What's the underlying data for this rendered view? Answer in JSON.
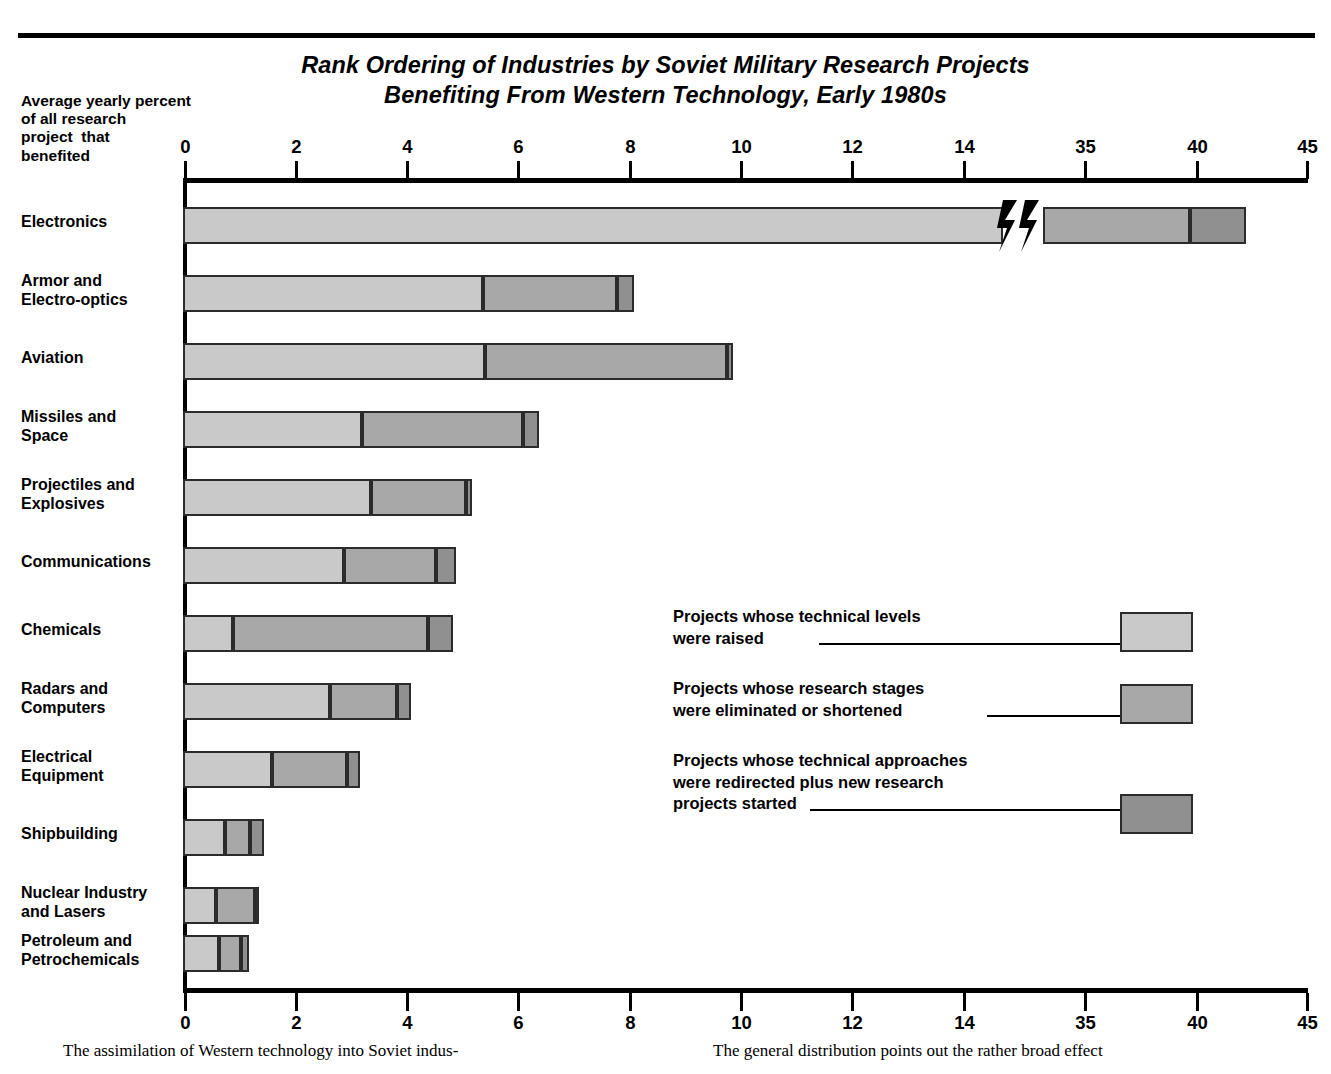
{
  "title": {
    "line1": "Rank Ordering of Industries by Soviet Military Research Projects",
    "line2": "Benefiting From Western Technology, Early 1980s"
  },
  "axis_caption": {
    "l1": "Average yearly percent",
    "l2": "of all research",
    "l3": "project  that",
    "l4": "benefited"
  },
  "legend": [
    {
      "l1": "Projects whose technical levels",
      "l2": "were raised",
      "l3": ""
    },
    {
      "l1": "Projects whose research stages",
      "l2": "were eliminated or shortened",
      "l3": ""
    },
    {
      "l1": "Projects whose technical approaches",
      "l2": "were redirected plus new research",
      "l3": "projects started"
    }
  ],
  "footer": {
    "left": "The assimilation of Western technology into Soviet indus-",
    "right": "The general distribution points out the rather broad effect"
  },
  "colors": {
    "light": "#c9c9c9",
    "medium": "#a8a8a8",
    "dark": "#909090",
    "outline": "#2b2b2b",
    "background": "#ffffff"
  },
  "chart_data": {
    "type": "bar",
    "orientation": "horizontal",
    "stacked": true,
    "title": "Rank Ordering of Industries by Soviet Military Research Projects Benefiting From Western Technology, Early 1980s",
    "xlabel": "Average yearly percent of all research project that benefited",
    "ylabel": "",
    "grid": false,
    "legend_position": "inside-right",
    "axis_break": {
      "between": [
        14,
        35
      ],
      "note": "x axis compressed between 14 and 35"
    },
    "xticks": [
      0,
      2,
      4,
      6,
      8,
      10,
      12,
      14,
      35,
      40,
      45
    ],
    "xlim": [
      0,
      45
    ],
    "categories": [
      "Electronics",
      "Armor and Electro-optics",
      "Aviation",
      "Missiles and Space",
      "Projectiles and Explosives",
      "Communications",
      "Chemicals",
      "Radars and Computers",
      "Electrical Equipment",
      "Shipbuilding",
      "Nuclear Industry and Lasers",
      "Petroleum and Petrochemicals"
    ],
    "series": [
      {
        "name": "Projects whose technical levels were raised",
        "values": [
          15.5,
          5.4,
          5.4,
          3.2,
          3.4,
          2.9,
          0.9,
          2.65,
          1.6,
          0.75,
          0.6,
          0.65
        ]
      },
      {
        "name": "Projects whose research stages were eliminated or shortened",
        "values": [
          21.0,
          2.4,
          2.8,
          2.9,
          1.7,
          1.65,
          3.5,
          1.2,
          1.35,
          0.45,
          0.7,
          0.4
        ]
      },
      {
        "name": "Projects whose technical approaches were redirected plus new research projects started",
        "values": [
          5.5,
          0.3,
          0.1,
          0.3,
          0.1,
          0.35,
          0.45,
          0.25,
          0.2,
          0.25,
          0.05,
          0.15
        ]
      }
    ],
    "totals": [
      42.0,
      12.7,
      9.7,
      6.4,
      5.2,
      5.0,
      4.8,
      4.05,
      3.1,
      1.45,
      1.3,
      1.1
    ]
  },
  "bars": [
    {
      "category": "Electronics",
      "lines": [
        "Electronics"
      ],
      "top": 207,
      "label_top": 212,
      "segs": [
        [
          183,
          1003
        ],
        [
          1043,
          1190
        ],
        [
          1190,
          1246
        ]
      ]
    },
    {
      "category": "Armor and Electro-optics",
      "lines": [
        "Armor and",
        "Electro-optics"
      ],
      "top": 275,
      "label_top": 271,
      "segs": [
        [
          183,
          483
        ],
        [
          483,
          617
        ],
        [
          617,
          634
        ]
      ]
    },
    {
      "category": "Aviation",
      "lines": [
        "Aviation"
      ],
      "top": 343,
      "label_top": 348,
      "segs": [
        [
          183,
          485
        ],
        [
          485,
          727
        ],
        [
          727,
          733
        ]
      ]
    },
    {
      "category": "Missiles and Space",
      "lines": [
        "Missiles and",
        "Space"
      ],
      "top": 411,
      "label_top": 407,
      "segs": [
        [
          183,
          362
        ],
        [
          362,
          523
        ],
        [
          523,
          539
        ]
      ]
    },
    {
      "category": "Projectiles and Explosives",
      "lines": [
        "Projectiles and",
        "Explosives"
      ],
      "top": 479,
      "label_top": 475,
      "segs": [
        [
          183,
          371
        ],
        [
          371,
          466
        ],
        [
          466,
          472
        ]
      ]
    },
    {
      "category": "Communications",
      "lines": [
        "Communications"
      ],
      "top": 547,
      "label_top": 552,
      "segs": [
        [
          183,
          344
        ],
        [
          344,
          436
        ],
        [
          436,
          456
        ]
      ]
    },
    {
      "category": "Chemicals",
      "lines": [
        "Chemicals"
      ],
      "top": 615,
      "label_top": 620,
      "segs": [
        [
          183,
          233
        ],
        [
          233,
          428
        ],
        [
          428,
          453
        ]
      ]
    },
    {
      "category": "Radars and Computers",
      "lines": [
        "Radars and",
        "Computers"
      ],
      "top": 683,
      "label_top": 679,
      "segs": [
        [
          183,
          330
        ],
        [
          330,
          397
        ],
        [
          397,
          411
        ]
      ]
    },
    {
      "category": "Electrical Equipment",
      "lines": [
        "Electrical",
        "Equipment"
      ],
      "top": 751,
      "label_top": 747,
      "segs": [
        [
          183,
          272
        ],
        [
          272,
          347
        ],
        [
          347,
          360
        ]
      ]
    },
    {
      "category": "Shipbuilding",
      "lines": [
        "Shipbuilding"
      ],
      "top": 819,
      "label_top": 824,
      "segs": [
        [
          183,
          225
        ],
        [
          225,
          250
        ],
        [
          250,
          264
        ]
      ]
    },
    {
      "category": "Nuclear Industry and Lasers",
      "lines": [
        "Nuclear Industry",
        "and Lasers"
      ],
      "top": 887,
      "label_top": 883,
      "segs": [
        [
          183,
          216
        ],
        [
          216,
          255
        ],
        [
          255,
          258
        ]
      ]
    },
    {
      "category": "Petroleum and Petrochemicals",
      "lines": [
        "Petroleum and",
        "Petrochemicals"
      ],
      "top": 935,
      "label_top": 931,
      "segs": [
        [
          183,
          219
        ],
        [
          219,
          241
        ],
        [
          241,
          249
        ]
      ]
    }
  ],
  "ticks": [
    {
      "label": "0",
      "x": 184
    },
    {
      "label": "2",
      "x": 295
    },
    {
      "label": "4",
      "x": 406
    },
    {
      "label": "6",
      "x": 517
    },
    {
      "label": "8",
      "x": 629
    },
    {
      "label": "10",
      "x": 740
    },
    {
      "label": "12",
      "x": 851
    },
    {
      "label": "14",
      "x": 963
    },
    {
      "label": "35",
      "x": 1084
    },
    {
      "label": "40",
      "x": 1196
    },
    {
      "label": "45",
      "x": 1306
    }
  ]
}
